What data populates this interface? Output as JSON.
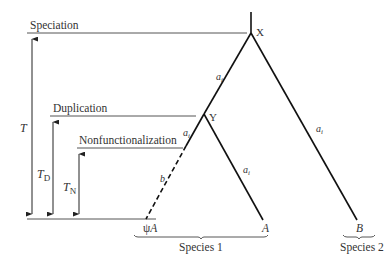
{
  "figure": {
    "events": {
      "speciation": "Speciation",
      "duplication": "Duplication",
      "nonfunctionalization": "Nonfunctionalization"
    },
    "nodes": {
      "x": "X",
      "y": "Y"
    },
    "branch_labels": {
      "x_to_y": "a",
      "x_to_y_sub": "i",
      "y_to_psi_upper": "a",
      "y_to_psi_upper_sub": "i",
      "y_to_psi_lower": "b",
      "y_to_a": "a",
      "y_to_a_sub": "i",
      "x_to_b": "a",
      "x_to_b_sub": "i"
    },
    "times": {
      "t_total": "T",
      "t_d": "T",
      "t_d_sub": "D",
      "t_n": "T",
      "t_n_sub": "N"
    },
    "leaves": {
      "psi_a_prefix": "ψ",
      "psi_a": "A",
      "a": "A",
      "b": "B"
    },
    "species": {
      "species1": "Species 1",
      "species2": "Species 2"
    },
    "colors": {
      "tree": "#111111",
      "guide": "#555555",
      "text": "#333333"
    }
  }
}
